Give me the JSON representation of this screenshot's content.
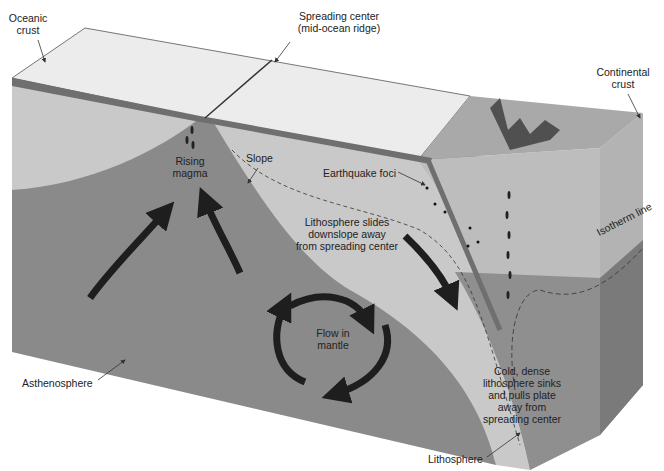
{
  "diagram": {
    "type": "block-diagram",
    "colors": {
      "background": "#ffffff",
      "ocean_top": "#ececec",
      "lithosphere": "#c9c9c9",
      "asthenosphere": "#8a8a8a",
      "asthenosphere_side": "#7a7a7a",
      "continental_top": "#a9a9a9",
      "continental_side": "#bdbdbd",
      "crust_band": "#6f6f6f",
      "arrows": "#1e1e1e",
      "text": "#222222"
    }
  },
  "labels": {
    "oceanic_crust": [
      "Oceanic",
      "crust"
    ],
    "spreading_center": [
      "Spreading center",
      "(mid-ocean ridge)"
    ],
    "continental_crust": [
      "Continental",
      "crust"
    ],
    "rising_magma": [
      "Rising",
      "magma"
    ],
    "slope": "Slope",
    "earthquake_foci": "Earthquake foci",
    "isotherm_line": "Isotherm line",
    "lithosphere_slides": [
      "Lithosphere slides",
      "downslope away",
      "from spreading center"
    ],
    "flow_in_mantle": [
      "Flow in",
      "mantle"
    ],
    "asthenosphere": "Asthenosphere",
    "cold_dense": [
      "Cold, dense",
      "lithosphere sinks",
      "and pulls plate",
      "away from",
      "spreading center"
    ],
    "lithosphere": "Lithosphere"
  }
}
